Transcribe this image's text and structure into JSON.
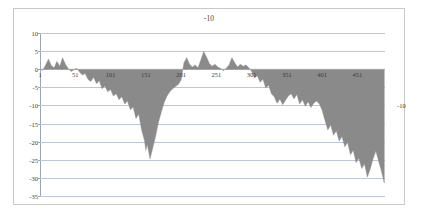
{
  "chart_data": {
    "type": "area",
    "title": "-10",
    "xlabel": "",
    "ylabel": "",
    "legend": {
      "position": "right",
      "entries": [
        "-10"
      ]
    },
    "grid": true,
    "xlim": [
      1,
      490
    ],
    "ylim": [
      -35,
      10
    ],
    "yticks": [
      10,
      5,
      0,
      -5,
      -10,
      -15,
      -20,
      -25,
      -30,
      -35
    ],
    "ytick_labels": [
      "10",
      "5",
      "0",
      "-5",
      "-10",
      "-15",
      "-20",
      "-25",
      "-30",
      "-35"
    ],
    "xticks": [
      1,
      51,
      101,
      151,
      201,
      251,
      301,
      351,
      401,
      451
    ],
    "xtick_labels": [
      "1",
      "51",
      "101",
      "151",
      "201",
      "251",
      "301",
      "351",
      "401",
      "451"
    ],
    "series": [
      {
        "name": "-10",
        "color": "#8a8a8a",
        "x": [
          1,
          5,
          9,
          13,
          17,
          21,
          25,
          29,
          33,
          37,
          41,
          45,
          49,
          53,
          57,
          61,
          65,
          69,
          73,
          77,
          81,
          85,
          89,
          93,
          97,
          101,
          105,
          109,
          113,
          117,
          121,
          125,
          129,
          133,
          137,
          141,
          145,
          149,
          151,
          153,
          157,
          161,
          165,
          169,
          173,
          177,
          181,
          185,
          189,
          193,
          197,
          201,
          205,
          209,
          213,
          217,
          221,
          225,
          229,
          233,
          237,
          241,
          245,
          249,
          253,
          257,
          261,
          265,
          269,
          273,
          277,
          281,
          285,
          289,
          293,
          297,
          301,
          305,
          309,
          313,
          317,
          321,
          325,
          329,
          333,
          337,
          341,
          345,
          349,
          353,
          357,
          361,
          365,
          369,
          373,
          377,
          381,
          385,
          389,
          393,
          397,
          401,
          405,
          409,
          413,
          417,
          421,
          425,
          429,
          433,
          437,
          441,
          445,
          449,
          453,
          457,
          461,
          465,
          469,
          473,
          477,
          481,
          485,
          489
        ],
        "values": [
          0,
          -0.3,
          1.2,
          2.8,
          1.0,
          0.4,
          2.2,
          0.8,
          3.2,
          1.4,
          0.2,
          -0.6,
          -0.2,
          0.3,
          -0.8,
          -1.6,
          -1.2,
          -2.8,
          -3.4,
          -2.2,
          -4.0,
          -3.2,
          -5.4,
          -4.6,
          -6.2,
          -5.6,
          -7.4,
          -6.8,
          -8.4,
          -7.6,
          -9.6,
          -8.8,
          -11.2,
          -10.4,
          -13.6,
          -12.4,
          -16.8,
          -19.6,
          -22.4,
          -20.8,
          -24.8,
          -21.6,
          -18.4,
          -14.6,
          -11.8,
          -9.2,
          -7.4,
          -6.2,
          -5.4,
          -4.8,
          -4.2,
          -3.0,
          1.8,
          3.2,
          1.4,
          0.6,
          1.2,
          0.4,
          2.6,
          4.9,
          3.4,
          1.6,
          0.8,
          1.4,
          0.6,
          0.2,
          -0.4,
          0.3,
          1.2,
          3.2,
          1.8,
          0.6,
          1.4,
          0.8,
          1.2,
          0.4,
          -0.6,
          -2.4,
          -1.8,
          -3.6,
          -2.8,
          -5.2,
          -4.4,
          -6.8,
          -7.6,
          -9.4,
          -8.2,
          -9.8,
          -8.6,
          -7.4,
          -6.8,
          -8.2,
          -7.0,
          -9.6,
          -8.4,
          -10.2,
          -9.0,
          -10.6,
          -9.4,
          -8.8,
          -9.6,
          -11.4,
          -14.2,
          -16.8,
          -15.4,
          -18.2,
          -17.0,
          -19.8,
          -18.6,
          -21.4,
          -20.2,
          -23.6,
          -22.4,
          -25.8,
          -24.6,
          -27.4,
          -26.2,
          -29.8,
          -27.6,
          -24.8,
          -22.6,
          -25.4,
          -28.2,
          -31.4
        ]
      }
    ]
  }
}
